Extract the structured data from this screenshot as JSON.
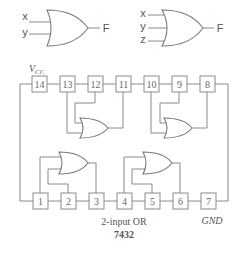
{
  "diagram": {
    "type": "logic-ic-pinout",
    "symbols": [
      {
        "name": "2-input OR gate",
        "inputs": [
          "x",
          "y"
        ],
        "output": "F"
      },
      {
        "name": "3-input OR gate",
        "inputs": [
          "x",
          "y",
          "z"
        ],
        "output": "F"
      }
    ],
    "chip": {
      "power_label": "V",
      "power_sub": "CC",
      "ground_label": "GND",
      "caption_line1": "2-input OR",
      "caption_line2": "7432",
      "top_pins": [
        "14",
        "13",
        "12",
        "11",
        "10",
        "9",
        "8"
      ],
      "bottom_pins": [
        "1",
        "2",
        "3",
        "4",
        "5",
        "6",
        "7"
      ],
      "gates": [
        {
          "inputs": [
            "1",
            "2"
          ],
          "output": "3"
        },
        {
          "inputs": [
            "4",
            "5"
          ],
          "output": "6"
        },
        {
          "inputs": [
            "13",
            "12"
          ],
          "output": "11"
        },
        {
          "inputs": [
            "10",
            "9"
          ],
          "output": "8"
        }
      ]
    }
  }
}
